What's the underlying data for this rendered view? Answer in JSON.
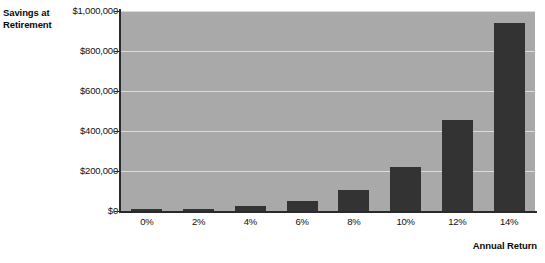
{
  "chart_data": {
    "type": "bar",
    "title": "",
    "subtitle": "",
    "xlabel": "Annual Return",
    "ylabel": "Savings at Retirement",
    "categories": [
      "0%",
      "2%",
      "4%",
      "6%",
      "8%",
      "10%",
      "12%",
      "14%"
    ],
    "values": [
      5000,
      12000,
      25000,
      52000,
      105000,
      220000,
      455000,
      940000
    ],
    "ylim": [
      0,
      1000000
    ],
    "ytick_values": [
      0,
      200000,
      400000,
      600000,
      800000,
      1000000
    ],
    "ytick_labels": [
      "$0",
      "$200,000",
      "$400,000",
      "$600,000",
      "$800,000",
      "$1,000,000"
    ],
    "grid": true,
    "legend": false,
    "legend_position": "none",
    "colors": {
      "bar": "#333333",
      "plot_background": "#a9a9a9",
      "gridline": "#e4e4e4",
      "axis_line": "#2a2a2a",
      "text": "#111111",
      "page_background": "#ffffff"
    }
  }
}
